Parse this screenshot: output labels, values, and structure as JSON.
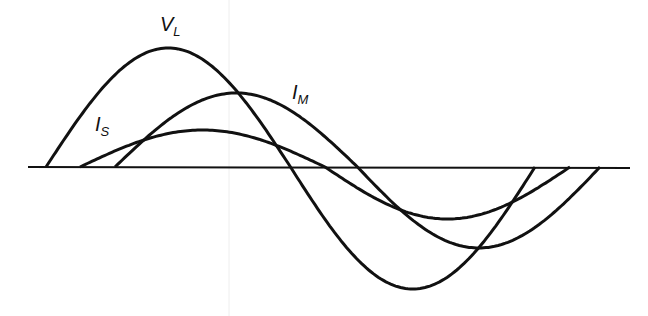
{
  "diagram": {
    "title": "",
    "stroke_color": "#111111",
    "background": "#ffffff",
    "axis": {
      "y": 167,
      "x_start": 28,
      "x_end": 630
    },
    "curves": [
      {
        "id": "VL",
        "label_main": "V",
        "label_sub": "L",
        "x0": 46,
        "x_end": 535,
        "amp_pos": 119,
        "amp_neg": 122
      },
      {
        "id": "IM",
        "label_main": "I",
        "label_sub": "M",
        "x0": 115,
        "x_end": 600,
        "amp_pos": 74,
        "amp_neg": 81
      },
      {
        "id": "IS",
        "label_main": "I",
        "label_sub": "S",
        "x0": 80,
        "x_end": 570,
        "amp_pos": 37,
        "amp_neg": 52
      }
    ],
    "labels": {
      "VL": {
        "main": "V",
        "sub": "L"
      },
      "IM": {
        "main": "I",
        "sub": "M"
      },
      "IS": {
        "main": "I",
        "sub": "S"
      }
    }
  }
}
